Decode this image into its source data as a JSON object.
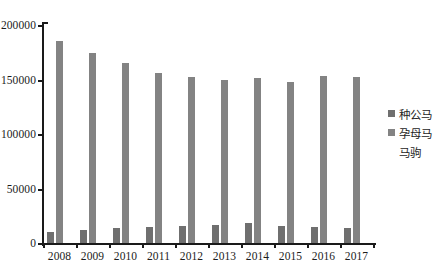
{
  "chart_data": {
    "type": "bar",
    "title": "",
    "subtitle": "",
    "xlabel": "",
    "ylabel": "",
    "ylim": [
      0,
      200000
    ],
    "ytick_labels": [
      "0",
      "50000",
      "100000",
      "150000",
      "200000"
    ],
    "ytick_values": [
      0,
      50000,
      100000,
      150000,
      200000
    ],
    "grid": false,
    "legend_position": "right",
    "categories": [
      "2008",
      "2009",
      "2010",
      "2011",
      "2012",
      "2013",
      "2014",
      "2015",
      "2016",
      "2017"
    ],
    "series": [
      {
        "name": "种公马",
        "color": "#6f6f6f",
        "values": [
          10500,
          12000,
          13500,
          15000,
          16000,
          16500,
          18000,
          15500,
          15000,
          13500
        ]
      },
      {
        "name": "孕母马",
        "color": "#838383",
        "values": [
          185000,
          174000,
          165000,
          156000,
          152000,
          150000,
          151000,
          148000,
          153000,
          152000
        ]
      },
      {
        "name": "马驹",
        "color": "#ffffff",
        "values": [
          0,
          0,
          0,
          0,
          0,
          0,
          0,
          0,
          0,
          0
        ]
      }
    ]
  },
  "legend": {
    "items": [
      {
        "label": "种公马",
        "swatch": "legend-swatch-stud-stallion"
      },
      {
        "label": "孕母马",
        "swatch": "legend-swatch-pregnant-mare"
      },
      {
        "label": "马驹",
        "swatch": "legend-swatch-foal"
      }
    ]
  }
}
